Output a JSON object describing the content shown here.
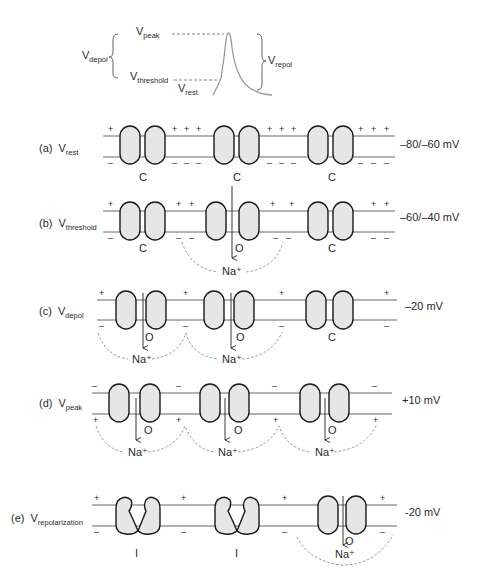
{
  "action_potential": {
    "labels": {
      "v_peak": {
        "main": "V",
        "sub": "peak"
      },
      "v_depol": {
        "main": "V",
        "sub": "depol"
      },
      "v_threshold": {
        "main": "V",
        "sub": "threshold"
      },
      "v_rest": {
        "main": "V",
        "sub": "rest"
      },
      "v_repol": {
        "main": "V",
        "sub": "repol"
      }
    }
  },
  "rows": [
    {
      "id": "a",
      "prefix": "(a)",
      "main": "V",
      "sub": "rest",
      "voltage": "–80/–60 mV",
      "channel_states": [
        "C",
        "C",
        "C"
      ]
    },
    {
      "id": "b",
      "prefix": "(b)",
      "main": "V",
      "sub": "threshold",
      "voltage": "–60/–40 mV",
      "channel_states": [
        "C",
        "O",
        "C"
      ],
      "ion": "Na⁺"
    },
    {
      "id": "c",
      "prefix": "(c)",
      "main": "V",
      "sub": "depol",
      "voltage": "–20 mV",
      "channel_states": [
        "O",
        "O",
        "C"
      ],
      "ion": "Na⁺"
    },
    {
      "id": "d",
      "prefix": "(d)",
      "main": "V",
      "sub": "peak",
      "voltage": "+10 mV",
      "channel_states": [
        "O",
        "O",
        "O"
      ],
      "ion": "Na⁺"
    },
    {
      "id": "e",
      "prefix": "(e)",
      "main": "V",
      "sub": "repolarization",
      "voltage": "-20 mV",
      "channel_states": [
        "I",
        "I",
        "O"
      ],
      "ion": "Na⁺"
    }
  ],
  "signs": {
    "plus": "+",
    "minus": "–"
  },
  "colors": {
    "channel_fill": "#e8e8e8",
    "channel_stroke": "#1a1a1a",
    "membrane": "#555555",
    "trace": "#888888",
    "dashed": "#777777"
  }
}
